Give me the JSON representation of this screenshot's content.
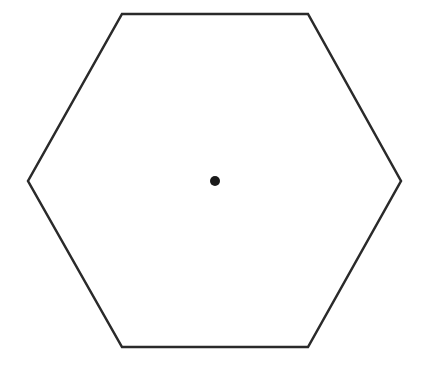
{
  "diagram": {
    "shape": "regular-hexagon",
    "vertices": [
      [
        122,
        14
      ],
      [
        308,
        14
      ],
      [
        401,
        181
      ],
      [
        308,
        347
      ],
      [
        122,
        347
      ],
      [
        28,
        181
      ]
    ],
    "stroke_color": "#2a2a2a",
    "stroke_width": 2.5,
    "fill_color": "#ffffff",
    "center_point": {
      "x": 215,
      "y": 181,
      "radius": 5,
      "color": "#1a1a1a"
    }
  }
}
